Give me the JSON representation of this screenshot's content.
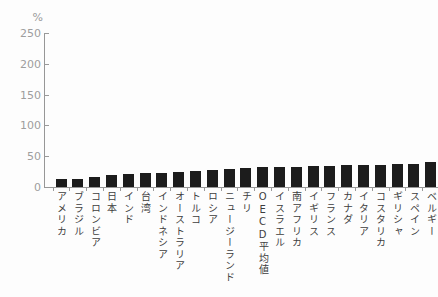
{
  "chart_data": {
    "type": "bar",
    "title": "",
    "unit_label": "%",
    "ylabel": "",
    "xlabel": "",
    "ylim": [
      0,
      250
    ],
    "yticks": [
      0,
      50,
      100,
      150,
      200,
      250
    ],
    "grid": false,
    "legend": false,
    "bar_color": "#1c1c1c",
    "categories": [
      "アメリカ",
      "ブラジル",
      "コロンビア",
      "日本",
      "インド",
      "台湾",
      "インドネシア",
      "オーストラリア",
      "トルコ",
      "ロシア",
      "ニュージーランド",
      "チリ",
      "OECD平均値",
      "イスラエル",
      "南アフリカ",
      "イギリス",
      "フランス",
      "カナダ",
      "イタリア",
      "コスタリカ",
      "ギリシャ",
      "スペイン",
      "ベルギー"
    ],
    "values": [
      13,
      13,
      17,
      20,
      21,
      22,
      23,
      25,
      26,
      28,
      29,
      31,
      32,
      33,
      33,
      34,
      34,
      35,
      35,
      36,
      37,
      38,
      40
    ],
    "last_category_clipped_at_right_edge": true
  }
}
